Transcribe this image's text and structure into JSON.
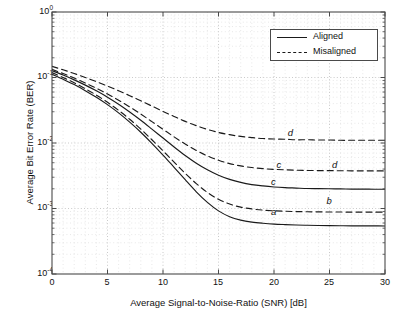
{
  "chart_data": {
    "type": "line",
    "title": "",
    "xlabel": "Average Signal-to-Noise-Ratio (SNR) [dB]",
    "ylabel": "Average Bit Error Rate (BER)",
    "xlim": [
      0,
      30
    ],
    "ylim": [
      0.0001,
      1
    ],
    "yscale": "log",
    "grid": true,
    "legend_position": "top-right",
    "xticks": [
      "0",
      "5",
      "10",
      "15",
      "20",
      "25",
      "30"
    ],
    "xtick_values": [
      0,
      5,
      10,
      15,
      20,
      25,
      30
    ],
    "yticks": [
      "10⁰",
      "10⁻¹",
      "10⁻²",
      "10⁻³",
      "10⁻⁴"
    ],
    "ytick_values": [
      1,
      0.1,
      0.01,
      0.001,
      0.0001
    ],
    "ytick_mantissa": [
      "10",
      "10",
      "10",
      "10",
      "10"
    ],
    "ytick_exponent": [
      "0",
      "-1",
      "-2",
      "-3",
      "-4"
    ],
    "legend": [
      {
        "label": "Aligned",
        "style": "solid"
      },
      {
        "label": "Misaligned",
        "style": "dashed"
      }
    ],
    "x": [
      0,
      1,
      2,
      3,
      4,
      5,
      6,
      7,
      8,
      9,
      10,
      11,
      12,
      13,
      14,
      15,
      16,
      17,
      18,
      19,
      20,
      21,
      22,
      23,
      24,
      25,
      26,
      27,
      28,
      29,
      30
    ],
    "series": [
      {
        "name": "a",
        "style": "solid",
        "legend_group": "Aligned",
        "annotation": "a",
        "annotation_x": 20,
        "annotation_y": 0.00088,
        "values": [
          0.112,
          0.094,
          0.078,
          0.063,
          0.05,
          0.0385,
          0.0288,
          0.0208,
          0.0146,
          0.0099,
          0.00655,
          0.00425,
          0.00275,
          0.0018,
          0.00124,
          0.00092,
          0.00075,
          0.000665,
          0.00062,
          0.000595,
          0.000578,
          0.000568,
          0.00056,
          0.000555,
          0.000551,
          0.000548,
          0.000546,
          0.000544,
          0.000543,
          0.000542,
          0.000541
        ]
      },
      {
        "name": "b",
        "style": "dashed",
        "legend_group": "Misaligned",
        "annotation": "b",
        "annotation_x": 25,
        "annotation_y": 0.00128,
        "values": [
          0.119,
          0.1,
          0.083,
          0.0675,
          0.0538,
          0.0418,
          0.0315,
          0.023,
          0.0163,
          0.0112,
          0.0076,
          0.0051,
          0.00345,
          0.0024,
          0.00176,
          0.00138,
          0.00117,
          0.00105,
          0.000985,
          0.000945,
          0.000922,
          0.000908,
          0.000898,
          0.000892,
          0.000888,
          0.000885,
          0.000883,
          0.000882,
          0.000881,
          0.00088,
          0.00088
        ]
      },
      {
        "name": "c-solid",
        "style": "solid",
        "legend_group": "Aligned",
        "annotation": "c",
        "annotation_x": 20,
        "annotation_y": 0.00255,
        "values": [
          0.127,
          0.109,
          0.092,
          0.0765,
          0.0625,
          0.05,
          0.039,
          0.0297,
          0.0222,
          0.0163,
          0.0119,
          0.0087,
          0.00645,
          0.00492,
          0.0039,
          0.00322,
          0.00278,
          0.0025,
          0.00232,
          0.00221,
          0.00213,
          0.00208,
          0.00205,
          0.00202,
          0.00201,
          0.002,
          0.00199,
          0.00198,
          0.00198,
          0.00197,
          0.00197
        ]
      },
      {
        "name": "c-dashed",
        "style": "dashed",
        "legend_group": "Misaligned",
        "annotation": "c",
        "annotation_x": 20.5,
        "annotation_y": 0.0046,
        "values": [
          0.133,
          0.115,
          0.098,
          0.0825,
          0.0685,
          0.056,
          0.045,
          0.0355,
          0.0276,
          0.0212,
          0.0162,
          0.0124,
          0.00965,
          0.0077,
          0.00635,
          0.00545,
          0.00485,
          0.00447,
          0.00422,
          0.00406,
          0.00396,
          0.00389,
          0.00384,
          0.00381,
          0.00379,
          0.00378,
          0.00377,
          0.00376,
          0.00376,
          0.00375,
          0.00375
        ]
      },
      {
        "name": "d",
        "style": "dashed",
        "legend_group": "Misaligned",
        "annotation": "d",
        "annotation_x": 21.5,
        "annotation_y": 0.0142,
        "values": [
          0.148,
          0.131,
          0.115,
          0.1,
          0.0865,
          0.074,
          0.0628,
          0.0528,
          0.044,
          0.0366,
          0.0304,
          0.0254,
          0.0214,
          0.0184,
          0.0161,
          0.0145,
          0.0134,
          0.0126,
          0.0121,
          0.0117,
          0.0115,
          0.0114,
          0.0112,
          0.0112,
          0.0111,
          0.0111,
          0.011,
          0.011,
          0.011,
          0.011,
          0.011
        ]
      }
    ],
    "annotations": [
      {
        "text": "d",
        "x": 21.5,
        "y": 0.0142
      },
      {
        "text": "c",
        "x": 20.5,
        "y": 0.0046
      },
      {
        "text": "d",
        "x": 25.5,
        "y": 0.0046
      },
      {
        "text": "c",
        "x": 20.0,
        "y": 0.00255
      },
      {
        "text": "a",
        "x": 20.0,
        "y": 0.00088
      },
      {
        "text": "b",
        "x": 25.0,
        "y": 0.00128
      }
    ]
  },
  "colors": {
    "line": "#1a1a1a",
    "axis": "#4a4a4a",
    "grid_major": "#b8b8b8",
    "grid_minor": "#d4d4d4",
    "background": "#ffffff"
  }
}
